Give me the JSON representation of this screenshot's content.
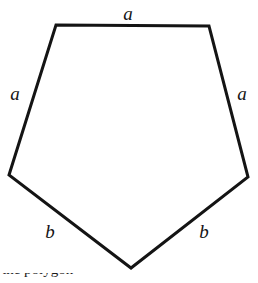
{
  "figure": {
    "name": "irregular-pentagon-with-side-labels",
    "background_color": "#ffffff",
    "stroke_color": "#141414",
    "stroke_width": 3,
    "fill_color": "none",
    "width": 258,
    "height": 283,
    "vertices": [
      {
        "name": "top-left",
        "x": 56,
        "y": 25
      },
      {
        "name": "top-right",
        "x": 209,
        "y": 26
      },
      {
        "name": "right",
        "x": 248,
        "y": 177
      },
      {
        "name": "bottom",
        "x": 131,
        "y": 268
      },
      {
        "name": "left",
        "x": 9,
        "y": 175
      }
    ],
    "polygon_points": "56,25 209,26 248,177 131,268 9,175",
    "labels": [
      {
        "name": "label-top-a",
        "text": "a",
        "x": 128,
        "y": 13,
        "side": "top"
      },
      {
        "name": "label-left-a",
        "text": "a",
        "x": 15,
        "y": 93,
        "side": "left-upper"
      },
      {
        "name": "label-right-a",
        "text": "a",
        "x": 242,
        "y": 93,
        "side": "right-upper"
      },
      {
        "name": "label-left-b",
        "text": "b",
        "x": 50,
        "y": 231,
        "side": "left-lower"
      },
      {
        "name": "label-right-b",
        "text": "b",
        "x": 204,
        "y": 231,
        "side": "right-lower"
      }
    ],
    "caption_sliver": {
      "text": "the polygon"
    }
  }
}
